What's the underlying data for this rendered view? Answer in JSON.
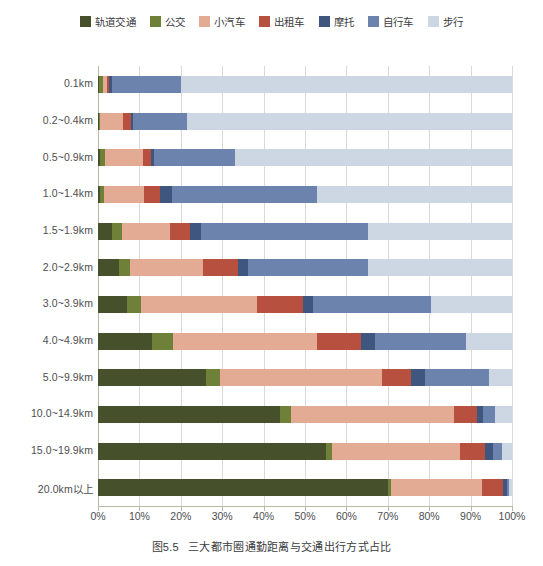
{
  "chart_data": {
    "type": "bar",
    "orientation": "horizontal",
    "stacked": true,
    "normalized": true,
    "title": "",
    "caption_number": "图5.5",
    "caption_text": "三大都市圈通勤距离与交通出行方式占比",
    "xlabel": "",
    "ylabel": "",
    "xlim": [
      0,
      100
    ],
    "xticks": [
      0,
      10,
      20,
      30,
      40,
      50,
      60,
      70,
      80,
      90,
      100
    ],
    "xtick_labels": [
      "0%",
      "10%",
      "20%",
      "30%",
      "40%",
      "50%",
      "60%",
      "70%",
      "80%",
      "90%",
      "100%"
    ],
    "grid": true,
    "legend_position": "top",
    "categories": [
      "0.1km",
      "0.2~0.4km",
      "0.5~0.9km",
      "1.0~1.4km",
      "1.5~1.9km",
      "2.0~2.9km",
      "3.0~3.9km",
      "4.0~4.9km",
      "5.0~9.9km",
      "10.0~14.9km",
      "15.0~19.9km",
      "20.0km以上"
    ],
    "series": [
      {
        "name": "轨道交通",
        "color": "#46512c",
        "values": [
          0.3,
          0.2,
          0.6,
          0.5,
          3.5,
          5.0,
          7.0,
          13.0,
          26.0,
          44.0,
          55.0,
          70.0
        ]
      },
      {
        "name": "公交",
        "color": "#6f8038",
        "values": [
          0.8,
          0.3,
          1.2,
          1.0,
          2.3,
          2.8,
          3.5,
          5.0,
          3.5,
          2.5,
          1.5,
          0.8
        ]
      },
      {
        "name": "小汽车",
        "color": "#e3ab93",
        "values": [
          1.2,
          5.5,
          9.0,
          9.5,
          11.5,
          17.5,
          28.0,
          35.0,
          39.0,
          39.5,
          31.0,
          22.0
        ]
      },
      {
        "name": "出租车",
        "color": "#b8503f",
        "values": [
          0.4,
          2.0,
          2.0,
          4.0,
          5.0,
          8.5,
          11.0,
          10.5,
          7.0,
          5.5,
          6.0,
          5.0
        ]
      },
      {
        "name": "摩托",
        "color": "#3f577f",
        "values": [
          0.6,
          0.5,
          0.7,
          3.0,
          2.5,
          2.5,
          2.5,
          3.5,
          3.5,
          1.5,
          2.0,
          1.0
        ]
      },
      {
        "name": "自行车",
        "color": "#6b83ad",
        "values": [
          16.7,
          13.0,
          19.5,
          35.0,
          40.5,
          29.0,
          28.5,
          22.0,
          15.5,
          3.0,
          2.0,
          0.5
        ]
      },
      {
        "name": "步行",
        "color": "#cdd7e3",
        "values": [
          80.0,
          78.5,
          67.0,
          47.0,
          34.7,
          34.7,
          19.5,
          11.0,
          5.5,
          4.0,
          2.5,
          0.7
        ]
      }
    ]
  }
}
